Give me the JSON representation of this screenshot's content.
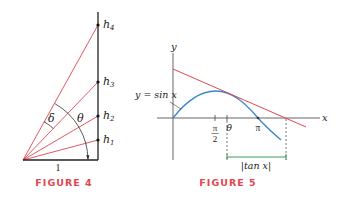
{
  "figures": [
    {
      "caption": "FIGURE 4",
      "labels": {
        "h1": "h",
        "h1_sub": "1",
        "h2": "h",
        "h2_sub": "2",
        "h3": "h",
        "h3_sub": "3",
        "h4": "h",
        "h4_sub": "4",
        "delta": "δ",
        "theta": "θ",
        "base": "1"
      }
    },
    {
      "caption": "FIGURE 5",
      "labels": {
        "y_axis": "y",
        "x_axis": "x",
        "curve": "y = sin x",
        "pi_over_2_num": "π",
        "pi_over_2_den": "2",
        "theta": "θ",
        "pi": "π",
        "bracket": "|tan x|"
      }
    }
  ],
  "colors": {
    "ray": "#e0464f",
    "tangent": "#e0464f",
    "sine": "#3a86c8",
    "bracket": "#3a9a55",
    "caption": "#e0464f",
    "axis": "#333333"
  }
}
